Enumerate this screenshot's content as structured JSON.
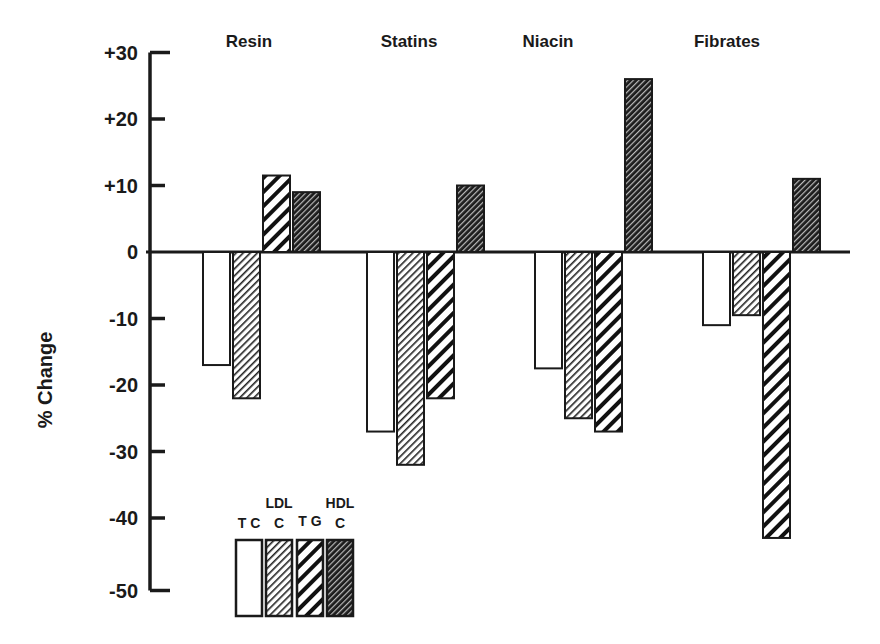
{
  "chart_data": {
    "type": "bar",
    "title": "",
    "xlabel": "",
    "ylabel": "% Change",
    "ylim": [
      -50,
      30
    ],
    "yticks": [
      "+30",
      "+20",
      "+10",
      "0",
      "-10",
      "-20",
      "-30",
      "-40",
      "-50"
    ],
    "ytick_values": [
      30,
      20,
      10,
      0,
      -10,
      -20,
      -30,
      -40,
      -50
    ],
    "grid": false,
    "legend_position": "lower-left inside",
    "categories": [
      "Resin",
      "Statins",
      "Niacin",
      "Fibrates"
    ],
    "series": [
      {
        "name": "TC",
        "legend_label": [
          "TC"
        ],
        "pattern": "open",
        "values": [
          -17,
          -27,
          -17.5,
          -11
        ]
      },
      {
        "name": "LDL C",
        "legend_label": [
          "LDL",
          "C"
        ],
        "pattern": "fine-hatch",
        "values": [
          -22,
          -32,
          -25,
          -9.5
        ]
      },
      {
        "name": "TG",
        "legend_label": [
          "TG"
        ],
        "pattern": "bold-hatch",
        "values": [
          11.5,
          -22,
          -27,
          -43
        ]
      },
      {
        "name": "HDL C",
        "legend_label": [
          "HDL",
          "C"
        ],
        "pattern": "dark-hatch",
        "values": [
          9,
          10,
          26,
          11
        ]
      }
    ]
  }
}
